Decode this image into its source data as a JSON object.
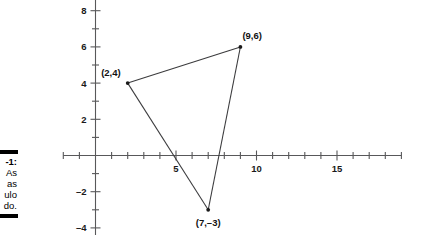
{
  "figure": {
    "caption": {
      "heading": "-1:",
      "lines": [
        "As",
        "as",
        "ulo",
        "do."
      ]
    }
  },
  "chart_data": {
    "type": "scatter",
    "title": "",
    "xlabel": "",
    "ylabel": "",
    "xlim": [
      -2,
      19
    ],
    "ylim": [
      -4.6,
      8.6
    ],
    "grid": false,
    "legend": "none",
    "x_ticks_major": [
      5,
      10,
      15
    ],
    "x_tick_labels": [
      "5",
      "10",
      "15"
    ],
    "x_tick_step_minor": 1,
    "y_ticks_major": [
      -4,
      -2,
      2,
      4,
      6,
      8
    ],
    "y_tick_labels": [
      "-4",
      "-2",
      "2",
      "4",
      "6",
      "8"
    ],
    "y_tick_step_minor": 1,
    "shape": "triangle",
    "points": [
      {
        "label": "(2,4)",
        "x": 2,
        "y": 4
      },
      {
        "label": "(9,6)",
        "x": 9,
        "y": 6
      },
      {
        "label": "(7,-3)",
        "x": 7,
        "y": -3
      }
    ],
    "edges": [
      [
        0,
        1
      ],
      [
        1,
        2
      ],
      [
        2,
        0
      ]
    ],
    "point_label_texts": [
      "(2,4)",
      "(9,6)",
      "(7,–3)"
    ],
    "colors": {
      "axis": "#58585a",
      "line": "#3b3b3d",
      "text": "#1a1a1a",
      "background": "#ffffff"
    }
  }
}
